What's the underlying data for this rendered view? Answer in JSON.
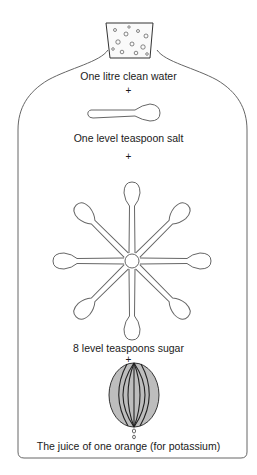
{
  "diagram": {
    "steps": [
      {
        "label": "One litre clean water",
        "icon": "bottle-with-stopper"
      },
      {
        "label": "One level teaspoon salt",
        "icon": "teaspoon",
        "count": 1
      },
      {
        "label": "8 level teaspoons sugar",
        "icon": "teaspoon",
        "count": 8
      },
      {
        "label": "The juice of one orange (for potassium)",
        "icon": "orange"
      }
    ],
    "plus": "+",
    "colors": {
      "line": "#555555",
      "orange_fill": "#bdbdbd",
      "text": "#1a1a1a"
    }
  }
}
